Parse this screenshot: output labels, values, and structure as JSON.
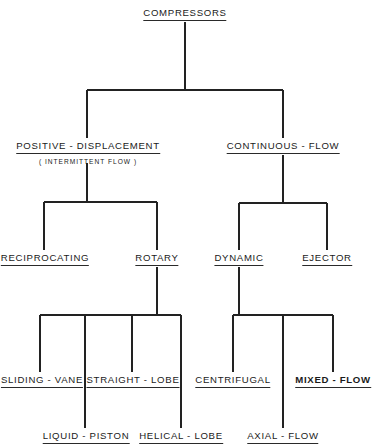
{
  "diagram": {
    "title": "COMPRESSORS",
    "line_color": "#222222",
    "nodes": [
      {
        "id": "compressors",
        "label": "COMPRESSORS",
        "x": 185,
        "y": 8,
        "bold": false
      },
      {
        "id": "positive-displacement",
        "label": "POSITIVE - DISPLACEMENT",
        "sub": "( INTERMITTENT FLOW )",
        "x": 88,
        "y": 141,
        "bold": false
      },
      {
        "id": "continuous-flow",
        "label": "CONTINUOUS - FLOW",
        "x": 283,
        "y": 141,
        "bold": false
      },
      {
        "id": "reciprocating",
        "label": "RECIPROCATING",
        "x": 45,
        "y": 253,
        "bold": false
      },
      {
        "id": "rotary",
        "label": "ROTARY",
        "x": 157,
        "y": 253,
        "bold": false
      },
      {
        "id": "dynamic",
        "label": "DYNAMIC",
        "x": 239,
        "y": 253,
        "bold": false
      },
      {
        "id": "ejector",
        "label": "EJECTOR",
        "x": 327,
        "y": 253,
        "bold": false
      },
      {
        "id": "sliding-vane",
        "label": "SLIDING - VANE",
        "x": 42,
        "y": 375,
        "bold": false
      },
      {
        "id": "straight-lobe",
        "label": "STRAIGHT - LOBE",
        "x": 133,
        "y": 375,
        "bold": false
      },
      {
        "id": "centrifugal",
        "label": "CENTRIFUGAL",
        "x": 233,
        "y": 375,
        "bold": false
      },
      {
        "id": "mixed-flow",
        "label": "MIXED - FLOW",
        "x": 333,
        "y": 375,
        "bold": true
      },
      {
        "id": "liquid-piston",
        "label": "LIQUID - PISTON",
        "x": 86,
        "y": 431,
        "bold": false
      },
      {
        "id": "helical-lobe",
        "label": "HELICAL - LOBE",
        "x": 181,
        "y": 431,
        "bold": false
      },
      {
        "id": "axial-flow",
        "label": "AXIAL - FLOW",
        "x": 283,
        "y": 431,
        "bold": false
      }
    ],
    "edges": [
      {
        "from": "compressors",
        "to": [
          "positive-displacement",
          "continuous-flow"
        ]
      },
      {
        "from": "positive-displacement",
        "to": [
          "reciprocating",
          "rotary"
        ]
      },
      {
        "from": "continuous-flow",
        "to": [
          "dynamic",
          "ejector"
        ]
      },
      {
        "from": "rotary",
        "to": [
          "sliding-vane",
          "liquid-piston",
          "straight-lobe",
          "helical-lobe"
        ]
      },
      {
        "from": "dynamic",
        "to": [
          "centrifugal",
          "axial-flow",
          "mixed-flow"
        ]
      }
    ],
    "lines": [
      {
        "x1": 185,
        "y1": 22,
        "x2": 185,
        "y2": 90
      },
      {
        "x1": 87,
        "y1": 90,
        "x2": 283,
        "y2": 90
      },
      {
        "x1": 87,
        "y1": 90,
        "x2": 87,
        "y2": 138
      },
      {
        "x1": 283,
        "y1": 90,
        "x2": 283,
        "y2": 138
      },
      {
        "x1": 87,
        "y1": 163,
        "x2": 87,
        "y2": 202
      },
      {
        "x1": 44,
        "y1": 202,
        "x2": 157,
        "y2": 202
      },
      {
        "x1": 44,
        "y1": 202,
        "x2": 44,
        "y2": 250
      },
      {
        "x1": 157,
        "y1": 202,
        "x2": 157,
        "y2": 250
      },
      {
        "x1": 283,
        "y1": 155,
        "x2": 283,
        "y2": 203
      },
      {
        "x1": 239,
        "y1": 203,
        "x2": 327,
        "y2": 203
      },
      {
        "x1": 239,
        "y1": 203,
        "x2": 239,
        "y2": 250
      },
      {
        "x1": 327,
        "y1": 203,
        "x2": 327,
        "y2": 250
      },
      {
        "x1": 157,
        "y1": 267,
        "x2": 157,
        "y2": 315
      },
      {
        "x1": 40,
        "y1": 315,
        "x2": 181,
        "y2": 315
      },
      {
        "x1": 40,
        "y1": 315,
        "x2": 40,
        "y2": 372
      },
      {
        "x1": 85,
        "y1": 315,
        "x2": 85,
        "y2": 428
      },
      {
        "x1": 132,
        "y1": 315,
        "x2": 132,
        "y2": 372
      },
      {
        "x1": 181,
        "y1": 315,
        "x2": 181,
        "y2": 428
      },
      {
        "x1": 239,
        "y1": 267,
        "x2": 239,
        "y2": 315
      },
      {
        "x1": 233,
        "y1": 315,
        "x2": 333,
        "y2": 315
      },
      {
        "x1": 233,
        "y1": 315,
        "x2": 233,
        "y2": 372
      },
      {
        "x1": 283,
        "y1": 315,
        "x2": 283,
        "y2": 428
      },
      {
        "x1": 333,
        "y1": 315,
        "x2": 333,
        "y2": 372
      }
    ]
  }
}
